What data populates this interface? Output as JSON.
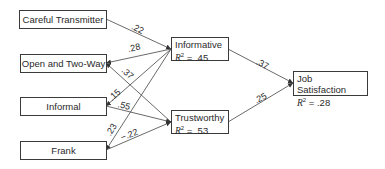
{
  "diagram": {
    "type": "path-diagram",
    "sources": [
      {
        "id": "careful",
        "label": "Careful Transmitter"
      },
      {
        "id": "open",
        "label": "Open and Two-Way"
      },
      {
        "id": "informal",
        "label": "Informal"
      },
      {
        "id": "frank",
        "label": "Frank"
      }
    ],
    "mediators": [
      {
        "id": "informative",
        "label": "Informative",
        "r2_label": "R",
        "r2_sup": "2",
        "r2_value": " = .45"
      },
      {
        "id": "trustworthy",
        "label": "Trustworthy",
        "r2_label": "R",
        "r2_sup": "2",
        "r2_value": " = .53"
      }
    ],
    "outcome": {
      "id": "job",
      "label": "Job Satisfaction",
      "r2_label": "R",
      "r2_sup": "2",
      "r2_value": " = .28"
    },
    "paths": [
      {
        "from": "careful",
        "to": "informative",
        "coef": ".22"
      },
      {
        "from": "open",
        "to": "informative",
        "coef": ".28"
      },
      {
        "from": "open",
        "to": "trustworthy",
        "coef": ".37"
      },
      {
        "from": "informal",
        "to": "informative",
        "coef": ".15"
      },
      {
        "from": "informal",
        "to": "trustworthy",
        "coef": ".55"
      },
      {
        "from": "frank",
        "to": "informative",
        "coef": ".23"
      },
      {
        "from": "frank",
        "to": "trustworthy",
        "coef": "−.22"
      },
      {
        "from": "informative",
        "to": "job",
        "coef": ".37"
      },
      {
        "from": "trustworthy",
        "to": "job",
        "coef": ".25"
      }
    ]
  }
}
